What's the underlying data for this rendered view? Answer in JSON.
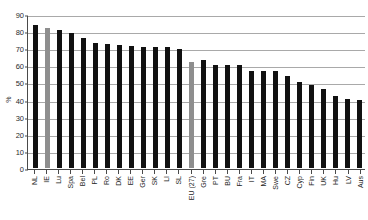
{
  "chart_data": {
    "type": "bar",
    "title": "",
    "xlabel": "",
    "ylabel": "%",
    "ylim": [
      0,
      90
    ],
    "yticks": [
      0,
      10,
      20,
      30,
      40,
      50,
      60,
      70,
      80,
      90
    ],
    "grid": true,
    "legend": "none",
    "categories": [
      "NL",
      "IE",
      "Lu",
      "Spa",
      "Bel",
      "PL",
      "Ro",
      "DK",
      "EE",
      "Ger",
      "SK",
      "LI",
      "SL",
      "EU (27)",
      "Gre",
      "PT",
      "BU",
      "Fra",
      "IT",
      "MA",
      "Swe",
      "CZ",
      "Cyp",
      "Fin",
      "UK",
      "Hu",
      "LV",
      "Aus"
    ],
    "values": [
      83.5,
      82.0,
      80.5,
      79.0,
      76.0,
      73.0,
      72.5,
      72.0,
      71.5,
      71.0,
      70.5,
      70.5,
      69.5,
      62.0,
      63.0,
      60.0,
      60.0,
      60.0,
      56.5,
      56.5,
      56.5,
      54.0,
      50.5,
      48.5,
      46.0,
      42.0,
      40.5,
      40.0
    ],
    "highlighted": [
      "IE",
      "EU (27)"
    ],
    "colors": {
      "bar": "#111111",
      "highlight": "#8e8e8e",
      "grid": "#a9a9a9",
      "axis": "#4a4a4a",
      "background": "#ffffff"
    }
  }
}
